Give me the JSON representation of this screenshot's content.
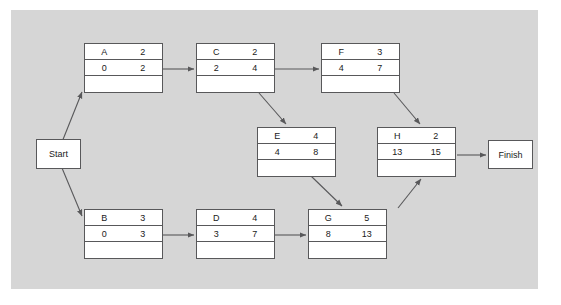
{
  "diagram": {
    "background_color": "#d6d6d6",
    "node_fill": "#ffffff",
    "line_color": "#58585a",
    "start_label": "Start",
    "finish_label": "Finish",
    "nodes": [
      {
        "id": "A",
        "name": "A",
        "duration": "2",
        "early_start": "0",
        "early_finish": "2",
        "slack": "",
        "x": 84,
        "y": 43
      },
      {
        "id": "C",
        "name": "C",
        "duration": "2",
        "early_start": "2",
        "early_finish": "4",
        "slack": "",
        "x": 196,
        "y": 43
      },
      {
        "id": "F",
        "name": "F",
        "duration": "3",
        "early_start": "4",
        "early_finish": "7",
        "slack": "",
        "x": 321,
        "y": 43
      },
      {
        "id": "E",
        "name": "E",
        "duration": "4",
        "early_start": "4",
        "early_finish": "8",
        "slack": "",
        "x": 257,
        "y": 127
      },
      {
        "id": "H",
        "name": "H",
        "duration": "2",
        "early_start": "13",
        "early_finish": "15",
        "slack": "",
        "x": 377,
        "y": 127
      },
      {
        "id": "B",
        "name": "B",
        "duration": "3",
        "early_start": "0",
        "early_finish": "3",
        "slack": "",
        "x": 84,
        "y": 209
      },
      {
        "id": "D",
        "name": "D",
        "duration": "4",
        "early_start": "3",
        "early_finish": "7",
        "slack": "",
        "x": 196,
        "y": 209
      },
      {
        "id": "G",
        "name": "G",
        "duration": "5",
        "early_start": "8",
        "early_finish": "13",
        "slack": "",
        "x": 308,
        "y": 209
      }
    ],
    "edges": [
      {
        "from": "Start",
        "to": "A"
      },
      {
        "from": "Start",
        "to": "B"
      },
      {
        "from": "A",
        "to": "C"
      },
      {
        "from": "C",
        "to": "F"
      },
      {
        "from": "C",
        "to": "E"
      },
      {
        "from": "F",
        "to": "H"
      },
      {
        "from": "E",
        "to": "G"
      },
      {
        "from": "B",
        "to": "D"
      },
      {
        "from": "D",
        "to": "G"
      },
      {
        "from": "G",
        "to": "H"
      },
      {
        "from": "H",
        "to": "Finish"
      }
    ]
  }
}
